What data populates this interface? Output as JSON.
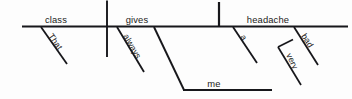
{
  "diagram": {
    "type": "reed-kellogg-sentence-diagram",
    "sentence": "That class always gives me a very bad headache.",
    "ink_color": "#17171b",
    "background_color": "#fdfdfd",
    "baseline": {
      "name": "main-baseline",
      "x1": 22,
      "y1": 26.5,
      "x2": 348,
      "y2": 26.5
    },
    "words": [
      {
        "id": "subject",
        "text": "class",
        "role": "subject",
        "orientation": "horizontal",
        "x": 56,
        "y": 22.5,
        "anchor": "middle"
      },
      {
        "id": "verb",
        "text": "gives",
        "role": "verb",
        "orientation": "horizontal",
        "x": 137,
        "y": 22.5,
        "anchor": "middle"
      },
      {
        "id": "direct-object",
        "text": "headache",
        "role": "direct object",
        "orientation": "horizontal",
        "x": 268,
        "y": 22.5,
        "anchor": "middle"
      },
      {
        "id": "indirect-object",
        "text": "me",
        "role": "indirect object",
        "orientation": "horizontal",
        "x": 214,
        "y": 87,
        "anchor": "middle"
      },
      {
        "id": "modifier-that",
        "text": "That",
        "role": "demonstrative adjective modifying subject",
        "orientation": "slanted",
        "x": 48,
        "y": 36,
        "rotation": 55
      },
      {
        "id": "modifier-always",
        "text": "always",
        "role": "adverb modifying verb",
        "orientation": "slanted",
        "x": 123,
        "y": 36,
        "rotation": 60
      },
      {
        "id": "modifier-a",
        "text": "a",
        "role": "article modifying direct object",
        "orientation": "slanted",
        "x": 240,
        "y": 37,
        "rotation": 57
      },
      {
        "id": "modifier-bad",
        "text": "bad",
        "role": "adjective modifying direct object",
        "orientation": "slanted",
        "x": 301,
        "y": 36,
        "rotation": 57
      },
      {
        "id": "modifier-very",
        "text": "very",
        "role": "adverb modifying bad",
        "orientation": "slanted",
        "x": 290,
        "y": 57,
        "rotation": 64
      }
    ],
    "lines": [
      {
        "id": "subject-verb-divider",
        "kind": "vertical-crossing",
        "x1": 107,
        "y1": 0.5,
        "x2": 107,
        "y2": 57
      },
      {
        "id": "verb-object-divider",
        "kind": "vertical-upward",
        "x1": 219,
        "y1": 2,
        "x2": 219,
        "y2": 26.5
      },
      {
        "id": "that-slant",
        "kind": "slant",
        "x1": 41,
        "y1": 27,
        "x2": 67,
        "y2": 64
      },
      {
        "id": "always-slant",
        "kind": "slant",
        "x1": 117,
        "y1": 27,
        "x2": 144,
        "y2": 72
      },
      {
        "id": "a-slant",
        "kind": "slant",
        "x1": 233,
        "y1": 27,
        "x2": 257,
        "y2": 63
      },
      {
        "id": "bad-slant",
        "kind": "slant",
        "x1": 294,
        "y1": 27,
        "x2": 318,
        "y2": 65
      },
      {
        "id": "indirect-object-slant",
        "kind": "slant",
        "x1": 154,
        "y1": 27,
        "x2": 184,
        "y2": 90
      },
      {
        "id": "indirect-object-baseline",
        "kind": "horizontal",
        "x1": 183,
        "y1": 90,
        "x2": 272,
        "y2": 90
      },
      {
        "id": "very-connector",
        "kind": "horizontal-short",
        "x1": 278,
        "y1": 47,
        "x2": 292,
        "y2": 40
      },
      {
        "id": "very-slant",
        "kind": "slant",
        "x1": 278,
        "y1": 47,
        "x2": 301,
        "y2": 85
      }
    ]
  }
}
